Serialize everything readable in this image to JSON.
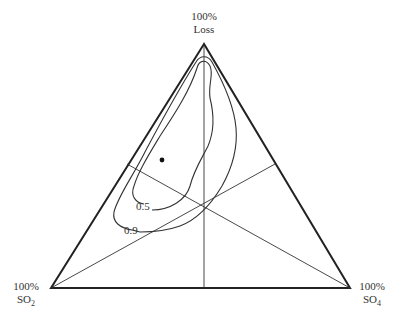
{
  "diagram": {
    "type": "ternary",
    "vertices": {
      "top": {
        "line1": "100%",
        "line2": "Loss"
      },
      "left": {
        "line1": "100%",
        "line2_main": "SO",
        "line2_sub": "2"
      },
      "right": {
        "line1": "100%",
        "line2_main": "SO",
        "line2_sub": "4"
      }
    },
    "contours": [
      {
        "label": "0.5"
      },
      {
        "label": "0.9"
      }
    ],
    "marker": "point",
    "colors": {
      "ink": "#222222",
      "background": "#ffffff"
    }
  }
}
